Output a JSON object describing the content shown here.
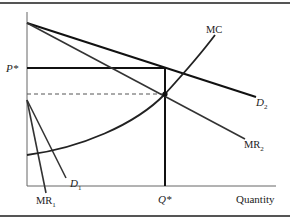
{
  "diagram": {
    "type": "economics-supply-demand",
    "axes": {
      "x_label": "Quantity",
      "y_label": ""
    },
    "labels": {
      "price_star": "P*",
      "quantity_star": "Q*",
      "mc": "MC",
      "d2": "D",
      "d2_sub": "2",
      "mr2": "MR",
      "mr2_sub": "2",
      "d1": "D",
      "d1_sub": "1",
      "mr1": "MR",
      "mr1_sub": "1"
    },
    "curves": [
      {
        "name": "D2",
        "kind": "demand",
        "from": [
          27,
          23
        ],
        "to": [
          256,
          97
        ]
      },
      {
        "name": "MR2",
        "kind": "marginal-revenue",
        "from": [
          27,
          23
        ],
        "to": [
          245,
          139
        ]
      },
      {
        "name": "D1",
        "kind": "demand",
        "from": [
          27,
          100
        ],
        "to": [
          66,
          178
        ]
      },
      {
        "name": "MR1",
        "kind": "marginal-revenue",
        "from": [
          27,
          100
        ],
        "to": [
          46,
          193
        ]
      },
      {
        "name": "MC",
        "kind": "marginal-cost",
        "shape": "convex-upward"
      }
    ],
    "reference_lines": {
      "p_star_y": 68,
      "q_star_x": 165,
      "dashed_y": 94
    },
    "colors": {
      "line": "#111111",
      "border": "#555555",
      "text": "#222222"
    }
  }
}
